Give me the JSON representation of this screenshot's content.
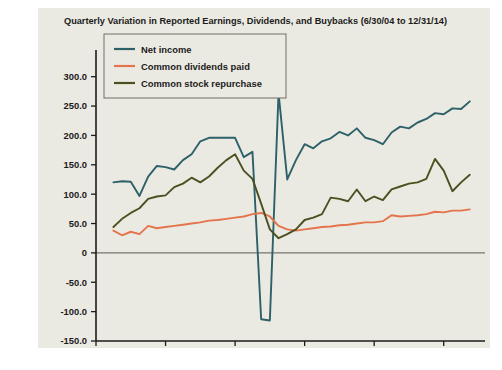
{
  "figure": {
    "background_color": "#ebeae2",
    "page_background_color": "#ffffff"
  },
  "chart_data": {
    "type": "line",
    "title": "Quarterly Variation in Reported Earnings, Dividends, and Buybacks (6/30/04 to 12/31/14)",
    "xlabel": "Year",
    "ylabel": "",
    "xlim": [
      2004.0,
      2014.9
    ],
    "ylim": [
      -150.0,
      325.0
    ],
    "grid": false,
    "legend_position": "upper-left",
    "xticks": [
      2004,
      2006,
      2008,
      2010,
      2012,
      2014
    ],
    "xtick_labels": [
      "2004",
      "2006",
      "2008",
      "2010",
      "2012",
      "2014"
    ],
    "yticks": [
      -150,
      -100,
      -50,
      0,
      50,
      100,
      150,
      200,
      250,
      300
    ],
    "ytick_labels": [
      "-150.0",
      "-100.0",
      "-50.0",
      "0",
      "50.0",
      "100.0",
      "150.0",
      "200.0",
      "250.0",
      "300.0"
    ],
    "x": [
      2004.5,
      2004.75,
      2005.0,
      2005.25,
      2005.5,
      2005.75,
      2006.0,
      2006.25,
      2006.5,
      2006.75,
      2007.0,
      2007.25,
      2007.5,
      2007.75,
      2008.0,
      2008.25,
      2008.5,
      2008.75,
      2009.0,
      2009.25,
      2009.5,
      2009.75,
      2010.0,
      2010.25,
      2010.5,
      2010.75,
      2011.0,
      2011.25,
      2011.5,
      2011.75,
      2012.0,
      2012.25,
      2012.5,
      2012.75,
      2013.0,
      2013.25,
      2013.5,
      2013.75,
      2014.0,
      2014.25,
      2014.5,
      2014.75
    ],
    "series": [
      {
        "name": "Net income",
        "color": "#2d6068",
        "values": [
          120,
          122,
          121,
          97,
          130,
          148,
          146,
          142,
          158,
          168,
          190,
          196,
          196,
          196,
          196,
          163,
          172,
          -113,
          -115,
          272,
          125,
          158,
          185,
          178,
          190,
          195,
          206,
          200,
          212,
          196,
          192,
          185,
          205,
          215,
          212,
          222,
          228,
          238,
          236,
          246,
          245,
          258
        ]
      },
      {
        "name": "Common dividends paid",
        "color": "#e4744c",
        "values": [
          38,
          30,
          36,
          32,
          46,
          42,
          44,
          46,
          48,
          50,
          52,
          55,
          56,
          58,
          60,
          62,
          66,
          68,
          62,
          46,
          40,
          38,
          40,
          42,
          44,
          45,
          47,
          48,
          50,
          52,
          52,
          54,
          64,
          62,
          63,
          64,
          66,
          70,
          69,
          72,
          72,
          74
        ]
      },
      {
        "name": "Common stock repurchase",
        "color": "#4c5021",
        "values": [
          44,
          58,
          68,
          76,
          92,
          96,
          98,
          112,
          118,
          128,
          120,
          130,
          145,
          158,
          168,
          140,
          126,
          84,
          40,
          25,
          32,
          40,
          56,
          60,
          66,
          94,
          92,
          88,
          108,
          88,
          96,
          90,
          108,
          113,
          118,
          120,
          126,
          160,
          140,
          105,
          120,
          133
        ]
      }
    ]
  },
  "legend": {
    "items": [
      {
        "label": "Net income",
        "color": "#2d6068"
      },
      {
        "label": "Common dividends paid",
        "color": "#e4744c"
      },
      {
        "label": "Common stock repurchase",
        "color": "#4c5021"
      }
    ]
  }
}
